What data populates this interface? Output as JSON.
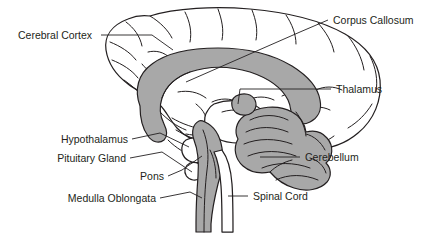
{
  "figure": {
    "kind": "anatomical-diagram",
    "background_color": "#ffffff",
    "line_color": "#231f20",
    "shade_color": "#a8a8a8"
  },
  "labels": {
    "cerebral_cortex": "Cerebral Cortex",
    "corpus_callosum": "Corpus Callosum",
    "thalamus": "Thalamus",
    "cerebellum": "Cerebellum",
    "hypothalamus": "Hypothalamus",
    "pituitary_gland": "Pituitary Gland",
    "pons": "Pons",
    "medulla_oblongata": "Medulla Oblongata",
    "spinal_cord": "Spinal Cord"
  }
}
